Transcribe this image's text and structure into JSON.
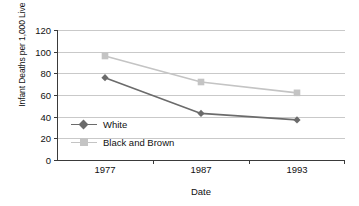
{
  "chart_data": {
    "type": "line",
    "title": "",
    "xlabel": "Date",
    "ylabel": "Infant Deaths per 1,000 Live Births",
    "categories": [
      "1977",
      "1987",
      "1993"
    ],
    "ylim": [
      0,
      120
    ],
    "yticks": [
      0,
      20,
      40,
      60,
      80,
      100,
      120
    ],
    "ytick_labels": [
      "0",
      "20",
      "40",
      "60",
      "80",
      "100",
      "120"
    ],
    "grid": "horizontal",
    "legend_position": "inside-lower-left",
    "series": [
      {
        "name": "White",
        "values": [
          76,
          43,
          37
        ],
        "color": "#6b6b6b",
        "marker": "diamond"
      },
      {
        "name": "Black and Brown",
        "values": [
          96,
          72,
          62
        ],
        "color": "#c4c4c4",
        "marker": "square"
      }
    ]
  },
  "legend": {
    "items": [
      {
        "label": "White",
        "color": "#6b6b6b",
        "marker": "diamond"
      },
      {
        "label": "Black and Brown",
        "color": "#c4c4c4",
        "marker": "square"
      }
    ]
  }
}
